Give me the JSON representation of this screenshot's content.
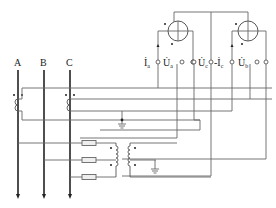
{
  "diagram": {
    "title": "",
    "phases": [
      {
        "label": "A"
      },
      {
        "label": "B"
      },
      {
        "label": "C"
      }
    ],
    "meters": [
      {
        "name": "wattmeter-1",
        "terminals": [
          {
            "symbol": "İ",
            "sub": "a"
          },
          {
            "symbol": "U̇",
            "sub": "a"
          },
          {
            "symbol": "",
            "sub": ""
          }
        ]
      },
      {
        "name": "wattmeter-2",
        "terminals": [
          {
            "symbol": "U̇",
            "sub": "c"
          },
          {
            "symbol": "-İ",
            "sub": "c"
          },
          {
            "symbol": "U̇",
            "sub": "b"
          },
          {
            "symbol": "",
            "sub": ""
          }
        ]
      }
    ],
    "labels": {
      "phase_a": "A",
      "phase_b": "B",
      "phase_c": "C",
      "ia_main": "İ",
      "ia_sub": "a",
      "ua_main": "U̇",
      "ua_sub": "a",
      "uc_main": "U̇",
      "uc_sub": "c",
      "ic_main": "-İ",
      "ic_sub": "c",
      "ub_main": "U̇",
      "ub_sub": "b"
    },
    "components": {
      "current_transformers": 2,
      "voltage_transformer_fuses": 3,
      "voltage_transformers": 2,
      "grounds": 2
    }
  }
}
